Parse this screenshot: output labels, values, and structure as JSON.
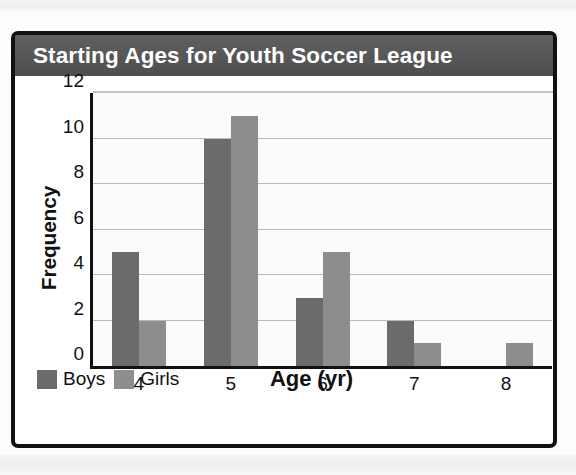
{
  "chart_data": {
    "type": "bar",
    "title": "Starting Ages for Youth Soccer League",
    "xlabel": "Age (yr)",
    "ylabel": "Frequency",
    "categories": [
      "4",
      "5",
      "6",
      "7",
      "8"
    ],
    "series": [
      {
        "name": "Boys",
        "color": "#6b6b6b",
        "values": [
          5,
          10,
          3,
          2,
          0
        ]
      },
      {
        "name": "Girls",
        "color": "#8d8d8d",
        "values": [
          2,
          11,
          5,
          1,
          1
        ]
      }
    ],
    "ylim": [
      0,
      12
    ],
    "yticks": [
      0,
      2,
      4,
      6,
      8,
      10,
      12
    ],
    "ytick_labels": [
      "0",
      "2",
      "4",
      "6",
      "8",
      "10",
      "12"
    ],
    "grid": true,
    "grid_axis": "y",
    "legend_position": "bottom-left",
    "title_background": "#5a5a5a",
    "title_color": "#ffffff",
    "plot_background": "#fbfbfa",
    "axis_color": "#111111",
    "gridline_color": "#b9b9b9"
  }
}
